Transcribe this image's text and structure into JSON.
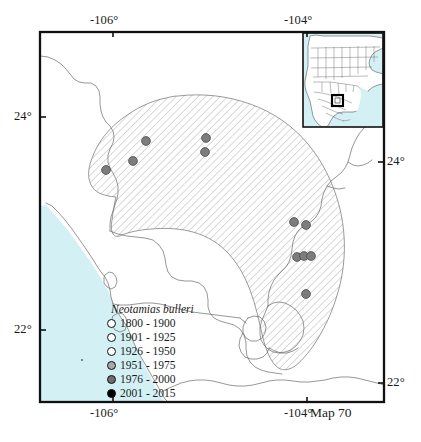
{
  "map": {
    "number_label": "Map 70",
    "species": "Neotamias bulleri",
    "frame": {
      "left": 40,
      "top": 32,
      "right": 384,
      "bottom": 402
    },
    "colors": {
      "ocean": "#d3f0f5",
      "land": "#ffffff",
      "frame": "#111111",
      "coastline": "#5a5a5a",
      "border": "#6a6a6a",
      "hatch": "#9b9b9b",
      "range_outline": "#777777",
      "point_fill": "#7d7d7d",
      "point_stroke": "#4a4a4a",
      "inset_frame": "#111111",
      "locator_box": "#000000"
    },
    "axes": {
      "top": [
        {
          "label": "-106°",
          "x": 113
        },
        {
          "label": "-104°",
          "x": 307
        }
      ],
      "bottom": [
        {
          "label": "-106°",
          "x": 113
        },
        {
          "label": "-104°",
          "x": 307
        }
      ],
      "left": [
        {
          "label": "24°",
          "y": 117
        },
        {
          "label": "22°",
          "y": 330
        }
      ],
      "right": [
        {
          "label": "24°",
          "y": 162
        },
        {
          "label": "22°",
          "y": 383
        }
      ]
    },
    "legend": {
      "title": "Neotamias bulleri",
      "entries": [
        {
          "label": "1800 - 1900",
          "fill": "#ffffff"
        },
        {
          "label": "1901 - 1925",
          "fill": "#ffffff"
        },
        {
          "label": "1926 - 1950",
          "fill": "#ffffff"
        },
        {
          "label": "1951 - 1975",
          "fill": "#a8a8a8"
        },
        {
          "label": "1976 - 2000",
          "fill": "#6e6e6e"
        },
        {
          "label": "2001 - 2015",
          "fill": "#000000"
        }
      ]
    },
    "occurrence_points": [
      {
        "x": 146,
        "y": 141,
        "class": "1976-2000"
      },
      {
        "x": 106,
        "y": 170,
        "class": "1976-2000"
      },
      {
        "x": 133,
        "y": 161,
        "class": "1976-2000"
      },
      {
        "x": 206,
        "y": 138,
        "class": "1976-2000"
      },
      {
        "x": 205,
        "y": 152,
        "class": "1976-2000"
      },
      {
        "x": 294,
        "y": 222,
        "class": "1976-2000"
      },
      {
        "x": 306,
        "y": 225,
        "class": "1976-2000"
      },
      {
        "x": 297,
        "y": 257,
        "class": "1976-2000"
      },
      {
        "x": 304,
        "y": 256,
        "class": "1976-2000"
      },
      {
        "x": 311,
        "y": 256,
        "class": "1976-2000"
      },
      {
        "x": 306,
        "y": 294,
        "class": "1976-2000"
      }
    ],
    "inset": {
      "region": "North America",
      "frame": {
        "left": 303,
        "top": 33,
        "right": 383,
        "bottom": 127
      },
      "locator_box": {
        "x": 332,
        "y": 95,
        "w": 11,
        "h": 11
      }
    }
  }
}
